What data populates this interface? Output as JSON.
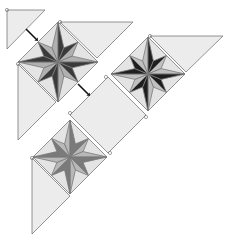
{
  "diagram": {
    "type": "on-point quilt layout with 8-pointed star blocks",
    "colors": {
      "background": "#ffffff",
      "setting_fill": "#ececec",
      "outline": "#7a7a7a",
      "star_dark_1": "#2b2b2b",
      "star_dark_2": "#777777",
      "star_light": "#b8b8b8",
      "block_bg": "#e4e4e4",
      "arrow": "#111111"
    },
    "star_blocks": [
      {
        "name": "star-block-1",
        "cx": 58,
        "cy": 62,
        "r": 40,
        "dark": "#3a3a3a",
        "mid": "#b0b0b0"
      },
      {
        "name": "star-block-2",
        "cx": 148,
        "cy": 74,
        "r": 37,
        "dark": "#1e1e1e",
        "mid": "#c0c0c0"
      },
      {
        "name": "star-block-3",
        "cx": 70,
        "cy": 157,
        "r": 37,
        "dark": "#7a7a7a",
        "mid": "#b8b8b8"
      }
    ],
    "setting_square": {
      "cx": 108,
      "cy": 115,
      "r": 38
    },
    "setting_triangles": [
      {
        "name": "corner-triangle-top-left",
        "points": "7,10 45,10 7,49"
      },
      {
        "name": "setting-triangle-top-1",
        "points": "60,22 133,22 97,58"
      },
      {
        "name": "setting-triangle-top-2",
        "points": "150,36 223,36 186,72"
      },
      {
        "name": "setting-triangle-left-1",
        "points": "18,64 56,102 18,140"
      },
      {
        "name": "setting-triangle-left-2",
        "points": "32,158 70,196 32,234"
      }
    ],
    "arrows": [
      {
        "name": "join-arrow-corner",
        "x1": 26,
        "y1": 29,
        "x2": 36,
        "y2": 39
      },
      {
        "name": "join-arrow-row",
        "x1": 78,
        "y1": 84,
        "x2": 88,
        "y2": 94
      }
    ]
  }
}
